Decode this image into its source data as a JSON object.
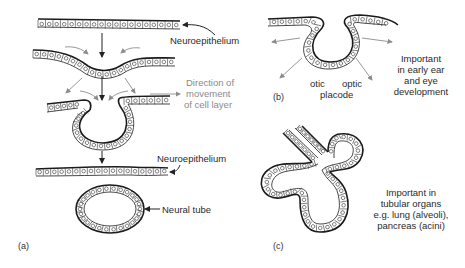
{
  "figure": {
    "panels": {
      "a": {
        "label": "(a)",
        "annotations": {
          "neuroepithelium_top": "Neuroepithelium",
          "direction_line1": "Direction of",
          "direction_line2": "movement",
          "direction_line3": "of cell layer",
          "neuroepithelium_bottom": "Neuroepithelium",
          "neural_tube": "Neural tube"
        }
      },
      "b": {
        "label": "(b)",
        "annotations": {
          "otic": "otic",
          "optic": "optic",
          "placode": "placode",
          "note_line1": "Important",
          "note_line2": "in early ear",
          "note_line3": "and eye",
          "note_line4": "development"
        }
      },
      "c": {
        "label": "(c)",
        "annotations": {
          "note_line1": "Important in",
          "note_line2": "tubular organs",
          "note_line3": "e.g. lung (alveoli),",
          "note_line4": "pancreas (acini)"
        }
      }
    },
    "colors": {
      "ink": "#1a1a1a",
      "grey_arrow": "#8c8c8c",
      "grey_text": "#8a8a8a"
    }
  }
}
